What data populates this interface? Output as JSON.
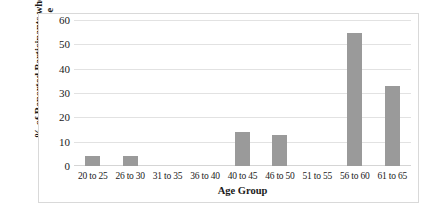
{
  "chart_data": {
    "type": "bar",
    "title": "",
    "xlabel": "Age Group",
    "ylabel_line1": "% of Reported Participants who",
    "ylabel_line2": "selected NONE for app use",
    "categories": [
      "20 to 25",
      "26 to 30",
      "31 to 35",
      "36 to 40",
      "40 to 45",
      "46 to 50",
      "51 to 55",
      "56 to 60",
      "61 to 65"
    ],
    "values": [
      4,
      4,
      0,
      0,
      14,
      13,
      0,
      55,
      33
    ],
    "yticks": [
      60,
      50,
      40,
      30,
      20,
      10,
      0
    ],
    "ylim": [
      0,
      60
    ],
    "grid": true,
    "legend": false,
    "bar_color": "#9a9a9a",
    "gridline_color": "#e2e2e2",
    "background_color": "#ffffff",
    "border_color": "#d9d9d9"
  }
}
